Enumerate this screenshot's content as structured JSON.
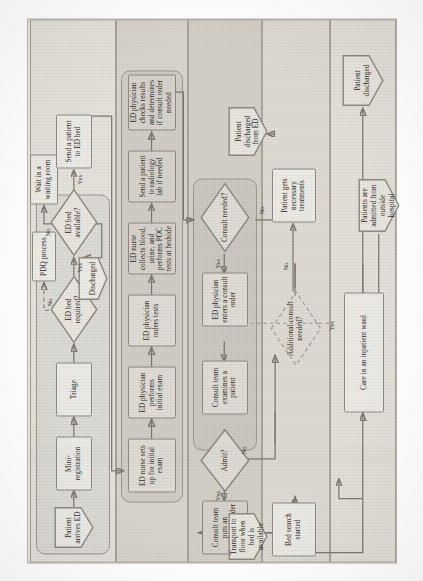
{
  "diagram": {
    "type": "flowchart",
    "orientation": "rotated-90-ccw",
    "colors": {
      "page_background": "#e9e7e2",
      "lane_light": "#e4e1db",
      "lane_mid": "#d8d4cd",
      "lane_dark": "#d3cfc7",
      "node_fill": "#ebe9e4",
      "node_fill_shaded": "#dedbd4",
      "stroke": "#8d8880",
      "text": "#2f2c28"
    }
  },
  "lanes": [
    {
      "id": "lane-arrival",
      "fill": "#e4e1db"
    },
    {
      "id": "lane-ed-workup",
      "fill": "#d8d4cd"
    },
    {
      "id": "lane-consult",
      "fill": "#d3cfc7"
    },
    {
      "id": "lane-disposition",
      "fill": "#dedad3"
    },
    {
      "id": "lane-inpatient",
      "fill": "#e2dfd8"
    }
  ],
  "nodes": {
    "patient_arrives_ed": "Patient arrives ED",
    "mini_registration": "Mini-registration",
    "triage": "Triage",
    "ed_bed_required": "ED bed required?",
    "ed_bed_available": "ED bed available?",
    "pdq_process": "PDQ process",
    "discharged": "Discharged",
    "wait_in_waiting_room": "Wait in a waiting room",
    "send_patient_to_ed_bed": "Send a patient to ED bed",
    "ed_nurse_sets_up": "ED nurse sets up for initial exam",
    "ed_physician_initial_exam": "ED physician performs initial exam",
    "ed_physician_orders_tests": "ED physician orders tests",
    "ed_nurse_collects": "ED nurse collects blood, urine, and performs POC tests at bedside",
    "send_patient_radiology": "Send a patient to radiology lab if needed",
    "ed_physician_checks_results": "ED physician checks results and determines if consult order needed",
    "consult_needed": "Consult needed?",
    "ed_physician_enters_consult_order": "ED physician enters a consult order",
    "consult_team_examines": "Consult team examines a patient",
    "admit": "Admit?",
    "consult_team_admission_order": "Consult team puts an admission order",
    "bed_search_started": "Bed search started",
    "transport_to_floor": "Transport to floor when bed is available",
    "additional_consult_needed": "Additional consult needed?",
    "patient_gets_treatments": "Patient gets necessary treatments",
    "patient_discharged_from_ed": "Patient discharged from ED",
    "patients_admitted_outside": "Patients are admitted from outside hospital",
    "care_inpatient_ward": "Care in an inpatient ward",
    "patient_discharged": "Patient discharged"
  },
  "edge_labels": {
    "bed_required_no": "No",
    "bed_required_yes": "Yes",
    "bed_available_no": "No",
    "bed_available_yes": "Yes",
    "consult_needed_yes": "Yes",
    "consult_needed_no": "No",
    "admit_yes": "Yes",
    "admit_no": "No",
    "additional_consult_yes": "Yes",
    "additional_consult_no": "No"
  }
}
